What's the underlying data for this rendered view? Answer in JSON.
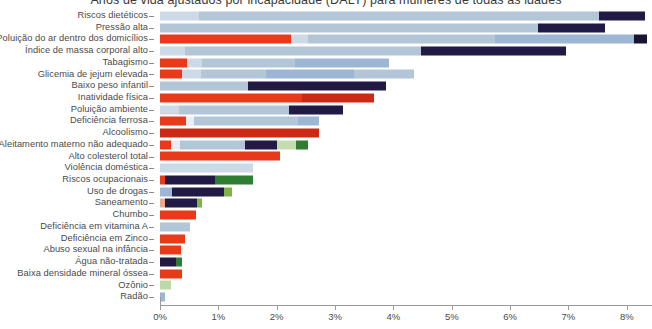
{
  "chart_data": {
    "type": "bar",
    "orientation": "horizontal",
    "stacked": true,
    "title": "Anos de vida ajustados por incapacidade (DALY) para mulheres de todas as idades",
    "xlabel": "",
    "ylabel": "",
    "xlim": [
      0,
      8.45
    ],
    "xticks": [
      0,
      1,
      2,
      3,
      4,
      5,
      6,
      7,
      8
    ],
    "xtick_labels": [
      "0%",
      "1%",
      "2%",
      "3%",
      "4%",
      "5%",
      "6%",
      "7%",
      "8%"
    ],
    "grid": false,
    "legend": "none",
    "categories": [
      "Riscos dietéticos",
      "Pressão alta",
      "Poluição do ar dentro dos domicílios",
      "Índice de massa corporal alto",
      "Tabagismo",
      "Glicemia de jejum elevada",
      "Baixo peso infantil",
      "Inatividade física",
      "Poluição ambiente",
      "Deficiência ferrosa",
      "Alcoolismo",
      "Aleitamento materno não adequado",
      "Alto colesterol total",
      "Violência doméstica",
      "Riscos ocupacionais",
      "Uso de drogas",
      "Saneamento",
      "Chumbo",
      "Deficiência em vitamina A",
      "Deficiência em Zinco",
      "Abuso sexual na infância",
      "Água não-tratada",
      "Baixa densidade mineral óssea",
      "Ozônio",
      "Radão"
    ],
    "totals": [
      8.32,
      7.63,
      1.95,
      6.95,
      2.02,
      5.36,
      3.53,
      5.01,
      2.78,
      3.15,
      2.46,
      2.04,
      1.6,
      1.52,
      1.22,
      0.7,
      0.61,
      0.5,
      0.39,
      0.34,
      0.34,
      0.34,
      0.18,
      0.08,
      0.02
    ],
    "bars": [
      {
        "category": "Riscos dietéticos",
        "total": 8.32,
        "segments": [
          {
            "color": "#cdd9e6",
            "value": 0.66
          },
          {
            "color": "#b3c6d8",
            "value": 6.86
          },
          {
            "color": "#211a44",
            "value": 0.8
          }
        ]
      },
      {
        "category": "Pressão alta",
        "total": 7.63,
        "segments": [
          {
            "color": "#b3c6d8",
            "value": 6.47
          },
          {
            "color": "#211a44",
            "value": 1.16
          }
        ]
      },
      {
        "category": "Poluição do ar dentro dos domicílios",
        "total": 1.95,
        "segments": [
          {
            "color": "#e8391a",
            "value": 2.25
          },
          {
            "color": "#cdd9e6",
            "value": 0.28
          },
          {
            "color": "#b3c6d8",
            "value": 3.22
          },
          {
            "color": "#9cb6d4",
            "value": 2.38
          },
          {
            "color": "#1a1433",
            "value": 0.22
          }
        ]
      },
      {
        "category": "Índice de massa corporal alto",
        "total": 6.95,
        "segments": [
          {
            "color": "#cdd9e6",
            "value": 0.42
          },
          {
            "color": "#b3c6d8",
            "value": 4.05
          },
          {
            "color": "#211a44",
            "value": 2.48
          }
        ]
      },
      {
        "category": "Tabagismo",
        "total": 2.02,
        "segments": [
          {
            "color": "#e8391a",
            "value": 0.46
          },
          {
            "color": "#cdd9e6",
            "value": 0.26
          },
          {
            "color": "#b3c6d8",
            "value": 1.6
          },
          {
            "color": "#9cb6d4",
            "value": 1.6
          }
        ]
      },
      {
        "category": "Glicemia de jejum elevada",
        "total": 5.36,
        "segments": [
          {
            "color": "#e8391a",
            "value": 0.37
          },
          {
            "color": "#cdd9e6",
            "value": 0.34
          },
          {
            "color": "#b3c6d8",
            "value": 1.1
          },
          {
            "color": "#9cb6d4",
            "value": 1.52
          },
          {
            "color": "#b3c6d8",
            "value": 1.02
          }
        ]
      },
      {
        "category": "Baixo peso infantil",
        "total": 3.53,
        "segments": [
          {
            "color": "#b3c6d8",
            "value": 1.5
          },
          {
            "color": "#211a44",
            "value": 2.38
          }
        ]
      },
      {
        "category": "Inatividade física",
        "total": 5.01,
        "segments": [
          {
            "color": "#e8391a",
            "value": 2.44
          },
          {
            "color": "#cc2a16",
            "value": 1.22
          }
        ]
      },
      {
        "category": "Poluição ambiente",
        "total": 2.78,
        "segments": [
          {
            "color": "#cdd9e6",
            "value": 0.33
          },
          {
            "color": "#b3c6d8",
            "value": 1.88
          },
          {
            "color": "#211a44",
            "value": 0.93
          }
        ]
      },
      {
        "category": "Deficiência ferrosa",
        "total": 3.15,
        "segments": [
          {
            "color": "#e8391a",
            "value": 0.44
          },
          {
            "color": "#e9eef4",
            "value": 0.14
          },
          {
            "color": "#b3c6d8",
            "value": 1.78
          },
          {
            "color": "#9cb6d4",
            "value": 0.36
          }
        ]
      },
      {
        "category": "Alcoolismo",
        "total": 2.46,
        "segments": [
          {
            "color": "#cc2a16",
            "value": 2.72
          }
        ]
      },
      {
        "category": "Aleitamento materno não adequado",
        "total": 2.04,
        "segments": [
          {
            "color": "#e8391a",
            "value": 0.18
          },
          {
            "color": "#e9eef4",
            "value": 0.16
          },
          {
            "color": "#b3c6d8",
            "value": 1.12
          },
          {
            "color": "#211a44",
            "value": 0.55
          },
          {
            "color": "#c3dcb0",
            "value": 0.32
          },
          {
            "color": "#2e7d32",
            "value": 0.21
          }
        ]
      },
      {
        "category": "Alto colesterol total",
        "total": 1.6,
        "segments": [
          {
            "color": "#e8391a",
            "value": 2.05
          }
        ]
      },
      {
        "category": "Violência doméstica",
        "total": 1.52,
        "segments": [
          {
            "color": "#cdd9e6",
            "value": 1.6
          }
        ]
      },
      {
        "category": "Riscos ocupacionais",
        "total": 1.22,
        "segments": [
          {
            "color": "#e8391a",
            "value": 0.08
          },
          {
            "color": "#211a44",
            "value": 0.86
          },
          {
            "color": "#2e7d32",
            "value": 0.66
          }
        ]
      },
      {
        "category": "Uso de drogas",
        "total": 0.7,
        "segments": [
          {
            "color": "#9cb6d4",
            "value": 0.21
          },
          {
            "color": "#211a44",
            "value": 0.88
          },
          {
            "color": "#7cb342",
            "value": 0.14
          }
        ]
      },
      {
        "category": "Saneamento",
        "total": 0.61,
        "segments": [
          {
            "color": "#e8a98f",
            "value": 0.08
          },
          {
            "color": "#211a44",
            "value": 0.56
          },
          {
            "color": "#7cb342",
            "value": 0.08
          }
        ]
      },
      {
        "category": "Chumbo",
        "total": 0.5,
        "segments": [
          {
            "color": "#e8391a",
            "value": 0.62
          }
        ]
      },
      {
        "category": "Deficiência em vitamina A",
        "total": 0.39,
        "segments": [
          {
            "color": "#b3c6d8",
            "value": 0.51
          }
        ]
      },
      {
        "category": "Deficiência em Zinco",
        "total": 0.34,
        "segments": [
          {
            "color": "#e8391a",
            "value": 0.42
          }
        ]
      },
      {
        "category": "Abuso sexual na infância",
        "total": 0.34,
        "segments": [
          {
            "color": "#e8391a",
            "value": 0.36
          }
        ]
      },
      {
        "category": "Água não-tratada",
        "total": 0.34,
        "segments": [
          {
            "color": "#211a44",
            "value": 0.28
          },
          {
            "color": "#2e7d32",
            "value": 0.1
          }
        ]
      },
      {
        "category": "Baixa densidade mineral óssea",
        "total": 0.18,
        "segments": [
          {
            "color": "#e8391a",
            "value": 0.37
          }
        ]
      },
      {
        "category": "Ozônio",
        "total": 0.08,
        "segments": [
          {
            "color": "#bcd9a8",
            "value": 0.19
          }
        ]
      },
      {
        "category": "Radão",
        "total": 0.02,
        "segments": [
          {
            "color": "#9cb6d4",
            "value": 0.08
          }
        ]
      }
    ]
  }
}
